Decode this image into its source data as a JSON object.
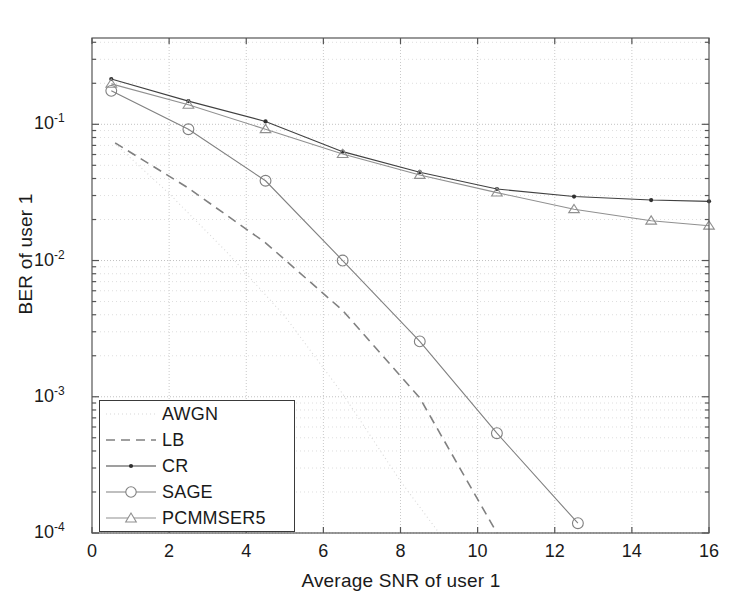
{
  "chart_data": {
    "type": "line",
    "title": "",
    "xlabel": "Average SNR of user 1",
    "ylabel": "BER of user 1",
    "xlim": [
      0,
      16
    ],
    "ylim": [
      0.0001,
      0.43
    ],
    "yscale": "log",
    "xticks": [
      0,
      2,
      4,
      6,
      8,
      10,
      12,
      14,
      16
    ],
    "xtick_labels": [
      "0",
      "2",
      "4",
      "6",
      "8",
      "10",
      "12",
      "14",
      "16"
    ],
    "yticks": [
      0.1,
      0.01,
      0.001,
      0.0001
    ],
    "ytick_labels": [
      "10",
      "10",
      "10",
      "10"
    ],
    "ytick_exponents": [
      "-1",
      "-2",
      "-3",
      "-4"
    ],
    "grid": true,
    "grid_style": "dotted",
    "legend_position": "lower left",
    "series": [
      {
        "name": "AWGN",
        "style": "dotted",
        "marker": "none",
        "color": "#d8d8d8",
        "x": [
          0.6,
          2.0,
          3.5,
          5.0,
          6.5,
          8.0,
          9.0
        ],
        "y": [
          0.072,
          0.031,
          0.0115,
          0.0039,
          0.00105,
          0.00024,
          0.0001
        ]
      },
      {
        "name": "LB",
        "style": "dashed",
        "marker": "none",
        "color": "#808080",
        "x": [
          0.6,
          2.5,
          4.5,
          6.5,
          8.5,
          10.5
        ],
        "y": [
          0.073,
          0.034,
          0.0135,
          0.0043,
          0.00098,
          0.0001
        ]
      },
      {
        "name": "CR",
        "style": "solid",
        "marker": "dot",
        "color": "#404040",
        "x": [
          0.5,
          2.5,
          4.5,
          6.5,
          8.5,
          10.5,
          12.5,
          14.5,
          16.0
        ],
        "y": [
          0.215,
          0.148,
          0.105,
          0.063,
          0.0445,
          0.0335,
          0.0295,
          0.0278,
          0.0272
        ]
      },
      {
        "name": "SAGE",
        "style": "solid",
        "marker": "circle",
        "color": "#808080",
        "x": [
          0.5,
          2.5,
          4.5,
          6.5,
          8.5,
          10.5,
          12.6
        ],
        "y": [
          0.176,
          0.092,
          0.0385,
          0.01,
          0.00255,
          0.00054,
          0.000118
        ]
      },
      {
        "name": "PCMMSER5",
        "style": "solid",
        "marker": "triangle",
        "color": "#909090",
        "x": [
          0.5,
          2.5,
          4.5,
          6.5,
          8.5,
          10.5,
          12.5,
          14.5,
          16.0
        ],
        "y": [
          0.198,
          0.139,
          0.092,
          0.0605,
          0.0425,
          0.0315,
          0.0238,
          0.0196,
          0.018
        ]
      }
    ]
  },
  "legend": {
    "items": [
      {
        "label": "AWGN"
      },
      {
        "label": "LB"
      },
      {
        "label": "CR"
      },
      {
        "label": "SAGE"
      },
      {
        "label": "PCMMSER5"
      }
    ]
  },
  "axes": {
    "x_title": "Average SNR of user 1",
    "y_title": "BER of user 1"
  }
}
